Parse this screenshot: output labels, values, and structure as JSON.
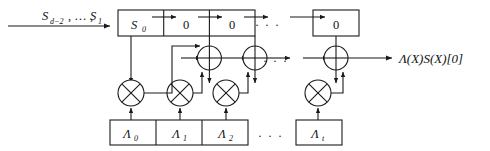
{
  "figure": {
    "stroke_color": "#1a1a1a",
    "text_color": "#111111",
    "background": "#ffffff"
  },
  "input": {
    "label": "S",
    "sub_from": "d−2",
    "mid": ", … ,",
    "label2": "S",
    "sub_to": "1",
    "full": "S_{d-2}, … , S_1"
  },
  "output": {
    "label": "Λ(X)S(X)[0]"
  },
  "shift_register": {
    "name": "shift-register",
    "cells": [
      {
        "value": "S",
        "sub": "0",
        "italic": true
      },
      {
        "value": "0",
        "sub": "",
        "italic": false
      },
      {
        "value": "0",
        "sub": "",
        "italic": false
      }
    ],
    "tail_cell": {
      "value": "0",
      "sub": "",
      "italic": false
    },
    "ellipsis": ". . ."
  },
  "coefficient_register": {
    "name": "coefficient-register",
    "cells": [
      {
        "value": "Λ",
        "sub": "0"
      },
      {
        "value": "Λ",
        "sub": "1"
      },
      {
        "value": "Λ",
        "sub": "2"
      }
    ],
    "tail_cell": {
      "value": "Λ",
      "sub": "t"
    },
    "ellipsis": ". . ."
  },
  "operators": {
    "xor_glyph": "⊕",
    "mult_glyph": "⊗",
    "xor_count": 3,
    "mult_count": 4,
    "middle_ellipsis": ". . ."
  }
}
